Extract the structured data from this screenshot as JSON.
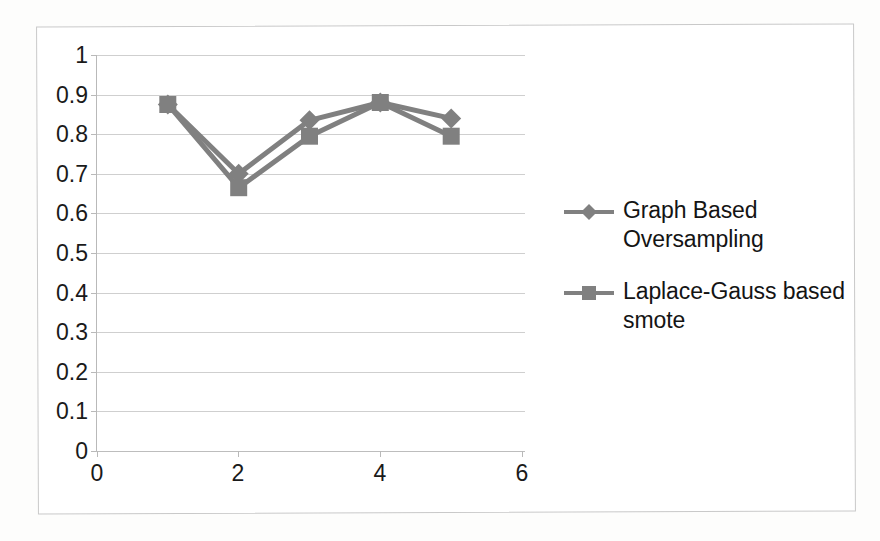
{
  "chart_data": {
    "type": "line",
    "title": "",
    "xlabel": "",
    "ylabel": "",
    "x": [
      1,
      2,
      3,
      4,
      5
    ],
    "xlim": [
      0,
      6
    ],
    "ylim": [
      0,
      1
    ],
    "x_ticks": [
      "0",
      "2",
      "4",
      "6"
    ],
    "x_tick_values": [
      0,
      2,
      4,
      6
    ],
    "y_ticks": [
      "0",
      "0.1",
      "0.2",
      "0.3",
      "0.4",
      "0.5",
      "0.6",
      "0.7",
      "0.8",
      "0.9",
      "1"
    ],
    "y_tick_values": [
      0,
      0.1,
      0.2,
      0.3,
      0.4,
      0.5,
      0.6,
      0.7,
      0.8,
      0.9,
      1
    ],
    "grid": "horizontal",
    "legend_position": "right",
    "series": [
      {
        "name": "Graph Based Oversampling",
        "marker": "diamond",
        "color": "#808080",
        "values": [
          0.875,
          0.7,
          0.835,
          0.88,
          0.84
        ]
      },
      {
        "name": "Laplace-Gauss based smote",
        "marker": "square",
        "color": "#808080",
        "values": [
          0.875,
          0.665,
          0.795,
          0.88,
          0.795
        ]
      }
    ]
  },
  "legend": {
    "entries": [
      {
        "label": "Graph Based Oversampling",
        "marker": "diamond-marker-icon"
      },
      {
        "label": "Laplace-Gauss based smote",
        "marker": "square-marker-icon"
      }
    ]
  },
  "colors": {
    "series": "#808080",
    "gridline": "#cfcfcf",
    "axis": "#b9b9b9",
    "frame": "#c9c9c9",
    "text": "#1a1a1a",
    "background": "#ffffff"
  }
}
